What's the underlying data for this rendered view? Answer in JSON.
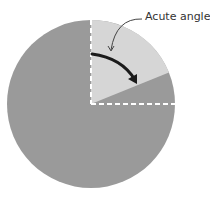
{
  "diagram": {
    "label": "Acute angle",
    "colors": {
      "circle": "#9a9a9a",
      "wedge": "#d6d6d6",
      "dashes": "#ffffff",
      "arrow": "#1a1a1a",
      "pointer": "#444444"
    },
    "angle_degrees": 68
  }
}
